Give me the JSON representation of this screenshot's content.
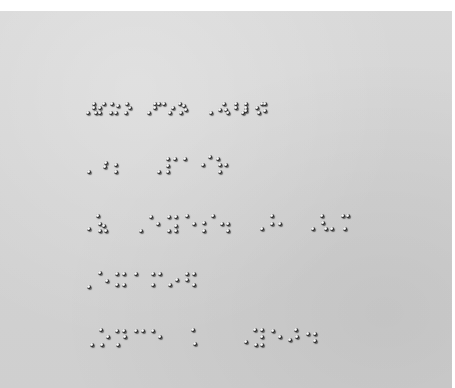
{
  "image": {
    "description": "Photograph of embossed braille text on gray paper",
    "background_color": "#ffffff",
    "paper_color": "#d4d4d4",
    "dot_color": "#111111"
  },
  "braille_lines": [
    {
      "y": 108,
      "dots": [
        [
          88,
          113
        ],
        [
          94,
          104
        ],
        [
          94,
          108
        ],
        [
          96,
          113
        ],
        [
          100,
          113
        ],
        [
          100,
          108
        ],
        [
          104,
          104
        ],
        [
          111,
          113
        ],
        [
          116,
          113
        ],
        [
          112,
          104
        ],
        [
          118,
          106
        ],
        [
          126,
          113
        ],
        [
          130,
          108
        ],
        [
          127,
          104
        ],
        [
          149,
          113
        ],
        [
          155,
          104
        ],
        [
          159,
          104
        ],
        [
          155,
          108
        ],
        [
          164,
          104
        ],
        [
          170,
          113
        ],
        [
          173,
          108
        ],
        [
          180,
          104
        ],
        [
          181,
          113
        ],
        [
          184,
          106
        ],
        [
          186,
          110
        ],
        [
          211,
          113
        ],
        [
          220,
          110
        ],
        [
          224,
          104
        ],
        [
          226,
          110
        ],
        [
          228,
          113
        ],
        [
          236,
          104
        ],
        [
          236,
          108
        ],
        [
          243,
          113
        ],
        [
          246,
          104
        ],
        [
          246,
          108
        ],
        [
          246,
          111
        ],
        [
          257,
          108
        ],
        [
          262,
          104
        ],
        [
          259,
          113
        ],
        [
          265,
          104
        ],
        [
          265,
          111
        ]
      ]
    },
    {
      "y": 163,
      "dots": [
        [
          89,
          172
        ],
        [
          106,
          163
        ],
        [
          105,
          167
        ],
        [
          116,
          165
        ],
        [
          116,
          172
        ],
        [
          159,
          172
        ],
        [
          168,
          159
        ],
        [
          175,
          159
        ],
        [
          168,
          166
        ],
        [
          168,
          172
        ],
        [
          185,
          159
        ],
        [
          203,
          165
        ],
        [
          210,
          157
        ],
        [
          218,
          159
        ],
        [
          220,
          165
        ],
        [
          220,
          172
        ],
        [
          226,
          165
        ]
      ]
    },
    {
      "y": 226,
      "dots": [
        [
          89,
          229
        ],
        [
          98,
          216
        ],
        [
          100,
          224
        ],
        [
          104,
          226
        ],
        [
          100,
          231
        ],
        [
          106,
          231
        ],
        [
          141,
          231
        ],
        [
          151,
          217
        ],
        [
          158,
          224
        ],
        [
          169,
          217
        ],
        [
          176,
          217
        ],
        [
          176,
          226
        ],
        [
          176,
          231
        ],
        [
          169,
          231
        ],
        [
          187,
          216
        ],
        [
          194,
          224
        ],
        [
          204,
          223
        ],
        [
          213,
          216
        ],
        [
          204,
          231
        ],
        [
          222,
          224
        ],
        [
          228,
          224
        ],
        [
          228,
          231
        ],
        [
          262,
          229
        ],
        [
          272,
          216
        ],
        [
          272,
          224
        ],
        [
          280,
          224
        ],
        [
          313,
          229
        ],
        [
          322,
          216
        ],
        [
          323,
          223
        ],
        [
          326,
          229
        ],
        [
          332,
          229
        ],
        [
          343,
          216
        ],
        [
          348,
          216
        ],
        [
          345,
          229
        ]
      ]
    },
    {
      "y": 278,
      "dots": [
        [
          89,
          287
        ],
        [
          100,
          273
        ],
        [
          107,
          281
        ],
        [
          117,
          274
        ],
        [
          124,
          274
        ],
        [
          117,
          285
        ],
        [
          124,
          285
        ],
        [
          136,
          274
        ],
        [
          153,
          274
        ],
        [
          160,
          274
        ],
        [
          153,
          285
        ],
        [
          170,
          285
        ],
        [
          177,
          280
        ],
        [
          187,
          274
        ],
        [
          194,
          274
        ],
        [
          187,
          280
        ],
        [
          194,
          285
        ]
      ]
    },
    {
      "y": 338,
      "dots": [
        [
          92,
          345
        ],
        [
          101,
          330
        ],
        [
          102,
          345
        ],
        [
          108,
          337
        ],
        [
          117,
          331
        ],
        [
          124,
          331
        ],
        [
          125,
          337
        ],
        [
          118,
          345
        ],
        [
          136,
          331
        ],
        [
          143,
          331
        ],
        [
          153,
          331
        ],
        [
          160,
          337
        ],
        [
          193,
          330
        ],
        [
          195,
          344
        ],
        [
          246,
          342
        ],
        [
          255,
          330
        ],
        [
          262,
          330
        ],
        [
          262,
          337
        ],
        [
          262,
          345
        ],
        [
          256,
          345
        ],
        [
          273,
          331
        ],
        [
          280,
          337
        ],
        [
          290,
          340
        ],
        [
          296,
          330
        ],
        [
          297,
          337
        ],
        [
          308,
          334
        ],
        [
          315,
          334
        ],
        [
          315,
          341
        ]
      ]
    }
  ]
}
